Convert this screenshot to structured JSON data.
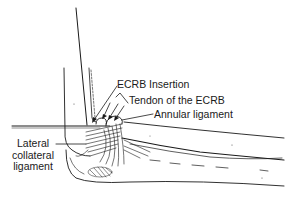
{
  "diagram": {
    "labels": [
      {
        "id": "ecrb-insertion",
        "text": "ECRB Insertion"
      },
      {
        "id": "tendon-ecrb",
        "text": "Tendon of the ECRB"
      },
      {
        "id": "annular-ligament",
        "text": "Annular ligament"
      },
      {
        "id": "lateral-collateral-ligament",
        "lines": [
          "Lateral",
          "collateral",
          "ligament"
        ]
      }
    ],
    "colors": {
      "ink": "#1a1a1a",
      "background": "#ffffff"
    }
  }
}
